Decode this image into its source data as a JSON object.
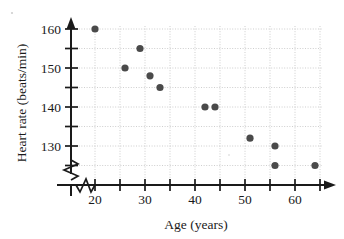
{
  "chart_data": {
    "type": "scatter",
    "title": "",
    "xlabel": "Age (years)",
    "ylabel": "Heart rate (beats/min)",
    "xlim": [
      16,
      66
    ],
    "ylim": [
      122,
      162
    ],
    "grid": true,
    "legend": "none",
    "x_major_ticks": [
      20,
      30,
      40,
      50,
      60
    ],
    "x_minor_ticks": [
      25,
      35,
      45,
      55,
      65
    ],
    "y_major_ticks": [
      130,
      140,
      150,
      160
    ],
    "y_minor_ticks": [
      125,
      135,
      145,
      155
    ],
    "x_tick_labels": [
      "20",
      "30",
      "40",
      "50",
      "60"
    ],
    "y_tick_labels": [
      "130",
      "140",
      "150",
      "160"
    ],
    "axis_break": "both",
    "marker": "filled-circle",
    "marker_color": "#4a4a4a",
    "points": [
      {
        "x": 20,
        "y": 160
      },
      {
        "x": 26,
        "y": 150
      },
      {
        "x": 29,
        "y": 155
      },
      {
        "x": 31,
        "y": 148
      },
      {
        "x": 33,
        "y": 145
      },
      {
        "x": 42,
        "y": 140
      },
      {
        "x": 44,
        "y": 140
      },
      {
        "x": 51,
        "y": 132
      },
      {
        "x": 56,
        "y": 130
      },
      {
        "x": 56,
        "y": 125
      },
      {
        "x": 64,
        "y": 125
      }
    ]
  },
  "figure": {
    "xlabel": "Age (years)",
    "ylabel": "Heart rate (beats/min)"
  }
}
